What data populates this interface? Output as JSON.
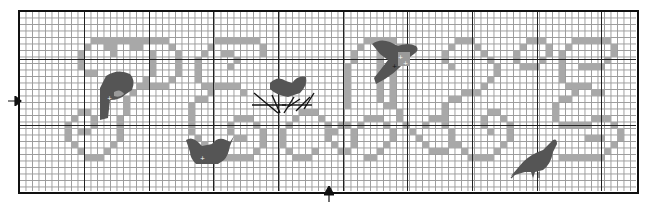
{
  "chart": {
    "type": "cross-stitch-pattern",
    "columns": 95,
    "rows": 28,
    "cell_px": 6.5,
    "major_every": 10,
    "colors": {
      "grid_minor": "#9a9a9a",
      "grid_major": "#222222",
      "letter_fill": "#a8a8a8",
      "bird_fill": "#555555",
      "frame": "#111111"
    },
    "major_v_px": [
      65,
      130,
      194,
      259,
      324,
      388,
      453,
      518,
      582
    ],
    "major_h_px": [
      48,
      114
    ],
    "center_markers": {
      "left_arrow": {
        "x": 14,
        "y": 101
      },
      "bottom_arrow": {
        "x": 329,
        "y": 192
      }
    },
    "letters": [
      {
        "name": "letter-1",
        "cells": [
          [
            11,
            4
          ],
          [
            12,
            4
          ],
          [
            13,
            4
          ],
          [
            14,
            4
          ],
          [
            15,
            4
          ],
          [
            16,
            4
          ],
          [
            17,
            4
          ],
          [
            18,
            4
          ],
          [
            19,
            4
          ],
          [
            20,
            4
          ],
          [
            21,
            4
          ],
          [
            22,
            4
          ],
          [
            10,
            5
          ],
          [
            23,
            5
          ],
          [
            9,
            6
          ],
          [
            13,
            5
          ],
          [
            14,
            5
          ],
          [
            17,
            5
          ],
          [
            18,
            5
          ],
          [
            24,
            6
          ],
          [
            14,
            6
          ],
          [
            24,
            7
          ],
          [
            9,
            7
          ],
          [
            9,
            8
          ],
          [
            24,
            8
          ],
          [
            10,
            9
          ],
          [
            11,
            9
          ],
          [
            24,
            9
          ],
          [
            23,
            10
          ],
          [
            22,
            11
          ],
          [
            18,
            11
          ],
          [
            19,
            11
          ],
          [
            20,
            11
          ],
          [
            21,
            11
          ],
          [
            17,
            12
          ],
          [
            16,
            13
          ],
          [
            16,
            14
          ],
          [
            16,
            15
          ],
          [
            15,
            16
          ],
          [
            15,
            17
          ],
          [
            15,
            18
          ],
          [
            15,
            19
          ],
          [
            14,
            20
          ],
          [
            13,
            21
          ],
          [
            12,
            22
          ],
          [
            11,
            22
          ],
          [
            10,
            22
          ],
          [
            9,
            21
          ],
          [
            8,
            20
          ],
          [
            7,
            19
          ],
          [
            7,
            18
          ],
          [
            7,
            17
          ],
          [
            8,
            16
          ],
          [
            9,
            15
          ],
          [
            10,
            15
          ],
          [
            11,
            16
          ],
          [
            11,
            17
          ],
          [
            10,
            18
          ],
          [
            9,
            18
          ],
          [
            20,
            6
          ],
          [
            20,
            7
          ],
          [
            20,
            8
          ],
          [
            20,
            9
          ],
          [
            19,
            10
          ]
        ]
      },
      {
        "name": "letter-2",
        "cells": [
          [
            30,
            4
          ],
          [
            31,
            4
          ],
          [
            32,
            4
          ],
          [
            33,
            4
          ],
          [
            34,
            4
          ],
          [
            35,
            4
          ],
          [
            36,
            4
          ],
          [
            29,
            5
          ],
          [
            37,
            5
          ],
          [
            28,
            6
          ],
          [
            37,
            6
          ],
          [
            27,
            7
          ],
          [
            27,
            8
          ],
          [
            31,
            6
          ],
          [
            32,
            6
          ],
          [
            33,
            7
          ],
          [
            32,
            8
          ],
          [
            27,
            9
          ],
          [
            27,
            10
          ],
          [
            28,
            11
          ],
          [
            29,
            11
          ],
          [
            30,
            11
          ],
          [
            31,
            11
          ],
          [
            32,
            11
          ],
          [
            33,
            11
          ],
          [
            29,
            12
          ],
          [
            34,
            12
          ],
          [
            27,
            13
          ],
          [
            28,
            13
          ],
          [
            26,
            14
          ],
          [
            26,
            15
          ],
          [
            26,
            16
          ],
          [
            26,
            17
          ],
          [
            26,
            18
          ],
          [
            27,
            19
          ],
          [
            28,
            20
          ],
          [
            29,
            21
          ],
          [
            30,
            22
          ],
          [
            31,
            22
          ],
          [
            32,
            22
          ],
          [
            33,
            22
          ],
          [
            34,
            22
          ],
          [
            35,
            22
          ],
          [
            36,
            21
          ],
          [
            37,
            20
          ],
          [
            37,
            19
          ],
          [
            37,
            18
          ],
          [
            36,
            17
          ],
          [
            35,
            16
          ],
          [
            34,
            16
          ],
          [
            33,
            16
          ],
          [
            32,
            17
          ],
          [
            32,
            18
          ],
          [
            33,
            19
          ],
          [
            34,
            19
          ]
        ]
      },
      {
        "name": "letter-3",
        "cells": [
          [
            42,
            16
          ],
          [
            43,
            15
          ],
          [
            44,
            15
          ],
          [
            45,
            15
          ],
          [
            46,
            16
          ],
          [
            47,
            17
          ],
          [
            47,
            18
          ],
          [
            47,
            19
          ],
          [
            48,
            20
          ],
          [
            49,
            21
          ],
          [
            50,
            21
          ],
          [
            51,
            20
          ],
          [
            51,
            19
          ],
          [
            51,
            18
          ],
          [
            50,
            17
          ],
          [
            49,
            17
          ],
          [
            48,
            18
          ],
          [
            41,
            17
          ],
          [
            40,
            18
          ],
          [
            40,
            19
          ],
          [
            40,
            20
          ],
          [
            41,
            21
          ],
          [
            42,
            22
          ],
          [
            43,
            22
          ],
          [
            44,
            22
          ],
          [
            45,
            21
          ],
          [
            52,
            17
          ],
          [
            53,
            16
          ],
          [
            54,
            16
          ],
          [
            55,
            16
          ],
          [
            56,
            17
          ],
          [
            57,
            18
          ],
          [
            57,
            19
          ],
          [
            56,
            20
          ],
          [
            55,
            21
          ],
          [
            54,
            22
          ],
          [
            53,
            22
          ]
        ]
      },
      {
        "name": "letter-4",
        "cells": [
          [
            53,
            4
          ],
          [
            54,
            4
          ],
          [
            55,
            4
          ],
          [
            56,
            4
          ],
          [
            57,
            4
          ],
          [
            52,
            5
          ],
          [
            58,
            5
          ],
          [
            51,
            6
          ],
          [
            51,
            7
          ],
          [
            50,
            8
          ],
          [
            50,
            9
          ],
          [
            50,
            10
          ],
          [
            50,
            11
          ],
          [
            50,
            12
          ],
          [
            50,
            13
          ],
          [
            50,
            14
          ],
          [
            57,
            6
          ],
          [
            57,
            7
          ],
          [
            57,
            8
          ],
          [
            57,
            9
          ],
          [
            57,
            10
          ],
          [
            57,
            11
          ],
          [
            57,
            12
          ],
          [
            57,
            13
          ],
          [
            57,
            14
          ],
          [
            58,
            15
          ],
          [
            58,
            16
          ],
          [
            55,
            5
          ],
          [
            55,
            6
          ],
          [
            55,
            7
          ],
          [
            55,
            8
          ],
          [
            55,
            9
          ],
          [
            55,
            10
          ],
          [
            55,
            11
          ],
          [
            55,
            12
          ],
          [
            55,
            13
          ],
          [
            56,
            14
          ],
          [
            59,
            17
          ],
          [
            60,
            18
          ],
          [
            61,
            19
          ],
          [
            62,
            20
          ],
          [
            63,
            21
          ],
          [
            64,
            21
          ],
          [
            65,
            21
          ],
          [
            66,
            20
          ],
          [
            66,
            19
          ],
          [
            66,
            18
          ],
          [
            65,
            17
          ],
          [
            64,
            16
          ],
          [
            63,
            16
          ],
          [
            62,
            17
          ]
        ]
      },
      {
        "name": "letter-5",
        "cells": [
          [
            67,
            4
          ],
          [
            68,
            4
          ],
          [
            69,
            4
          ],
          [
            66,
            5
          ],
          [
            70,
            5
          ],
          [
            65,
            6
          ],
          [
            71,
            6
          ],
          [
            65,
            7
          ],
          [
            72,
            7
          ],
          [
            66,
            8
          ],
          [
            73,
            8
          ],
          [
            73,
            9
          ],
          [
            72,
            10
          ],
          [
            71,
            11
          ],
          [
            70,
            12
          ],
          [
            69,
            12
          ],
          [
            68,
            12
          ],
          [
            67,
            13
          ],
          [
            66,
            13
          ],
          [
            65,
            14
          ],
          [
            65,
            15
          ],
          [
            65,
            16
          ],
          [
            65,
            17
          ],
          [
            66,
            18
          ],
          [
            66,
            19
          ],
          [
            67,
            20
          ],
          [
            68,
            21
          ],
          [
            69,
            22
          ],
          [
            70,
            22
          ],
          [
            71,
            22
          ],
          [
            72,
            22
          ],
          [
            73,
            21
          ],
          [
            74,
            20
          ],
          [
            75,
            19
          ],
          [
            75,
            18
          ],
          [
            75,
            17
          ],
          [
            74,
            16
          ],
          [
            73,
            15
          ],
          [
            72,
            15
          ],
          [
            71,
            16
          ],
          [
            71,
            17
          ],
          [
            72,
            18
          ],
          [
            78,
            4
          ],
          [
            79,
            4
          ],
          [
            80,
            4
          ],
          [
            77,
            5
          ],
          [
            81,
            5
          ],
          [
            76,
            6
          ],
          [
            81,
            6
          ],
          [
            76,
            7
          ],
          [
            80,
            7
          ],
          [
            77,
            8
          ],
          [
            78,
            8
          ],
          [
            79,
            8
          ]
        ]
      },
      {
        "name": "letter-6",
        "cells": [
          [
            85,
            4
          ],
          [
            86,
            4
          ],
          [
            87,
            4
          ],
          [
            88,
            4
          ],
          [
            89,
            4
          ],
          [
            90,
            4
          ],
          [
            84,
            5
          ],
          [
            91,
            5
          ],
          [
            83,
            6
          ],
          [
            91,
            6
          ],
          [
            83,
            7
          ],
          [
            90,
            7
          ],
          [
            83,
            8
          ],
          [
            86,
            8
          ],
          [
            87,
            8
          ],
          [
            88,
            8
          ],
          [
            89,
            8
          ],
          [
            83,
            9
          ],
          [
            83,
            10
          ],
          [
            84,
            11
          ],
          [
            85,
            11
          ],
          [
            86,
            11
          ],
          [
            87,
            11
          ],
          [
            85,
            12
          ],
          [
            88,
            12
          ],
          [
            89,
            12
          ],
          [
            83,
            13
          ],
          [
            84,
            13
          ],
          [
            82,
            14
          ],
          [
            82,
            15
          ],
          [
            82,
            16
          ],
          [
            83,
            17
          ],
          [
            84,
            17
          ],
          [
            85,
            17
          ],
          [
            86,
            17
          ],
          [
            87,
            17
          ],
          [
            88,
            16
          ],
          [
            89,
            16
          ],
          [
            90,
            16
          ],
          [
            91,
            17
          ],
          [
            92,
            18
          ],
          [
            92,
            19
          ],
          [
            91,
            20
          ],
          [
            90,
            21
          ],
          [
            89,
            22
          ],
          [
            88,
            22
          ],
          [
            87,
            22
          ],
          [
            86,
            22
          ],
          [
            85,
            22
          ],
          [
            84,
            22
          ],
          [
            83,
            22
          ],
          [
            87,
            19
          ],
          [
            88,
            19
          ],
          [
            89,
            19
          ]
        ]
      }
    ],
    "birds": [
      {
        "name": "bird-1",
        "x": 96,
        "y": 66,
        "w": 40,
        "h": 52,
        "shape": "perched-on-p"
      },
      {
        "name": "bird-2",
        "x": 186,
        "y": 137,
        "w": 46,
        "h": 26,
        "shape": "sitting"
      },
      {
        "name": "bird-3",
        "x": 252,
        "y": 70,
        "w": 70,
        "h": 36,
        "shape": "on-branches"
      },
      {
        "name": "bird-4",
        "x": 368,
        "y": 36,
        "w": 46,
        "h": 46,
        "shape": "flying"
      },
      {
        "name": "bird-5",
        "x": 512,
        "y": 136,
        "w": 50,
        "h": 36,
        "shape": "walking"
      }
    ]
  }
}
